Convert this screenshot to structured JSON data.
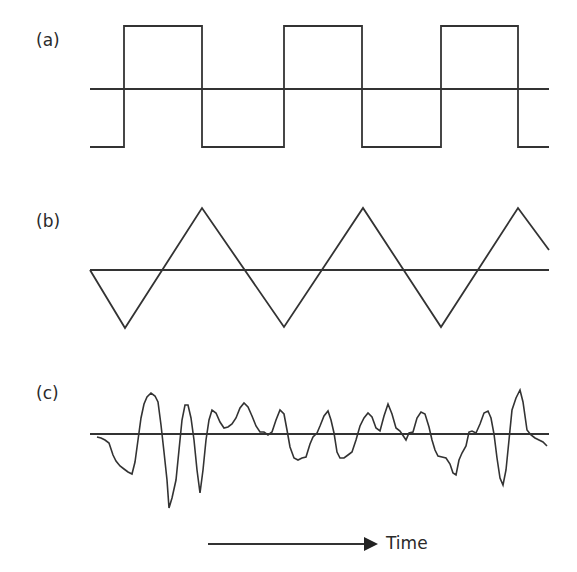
{
  "panels": [
    {
      "label": "(a)",
      "type": "square-wave"
    },
    {
      "label": "(b)",
      "type": "triangle-wave"
    },
    {
      "label": "(c)",
      "type": "irregular-wave"
    }
  ],
  "axis": {
    "label": "Time"
  },
  "colors": {
    "stroke": "#333333",
    "background": "#ffffff"
  }
}
